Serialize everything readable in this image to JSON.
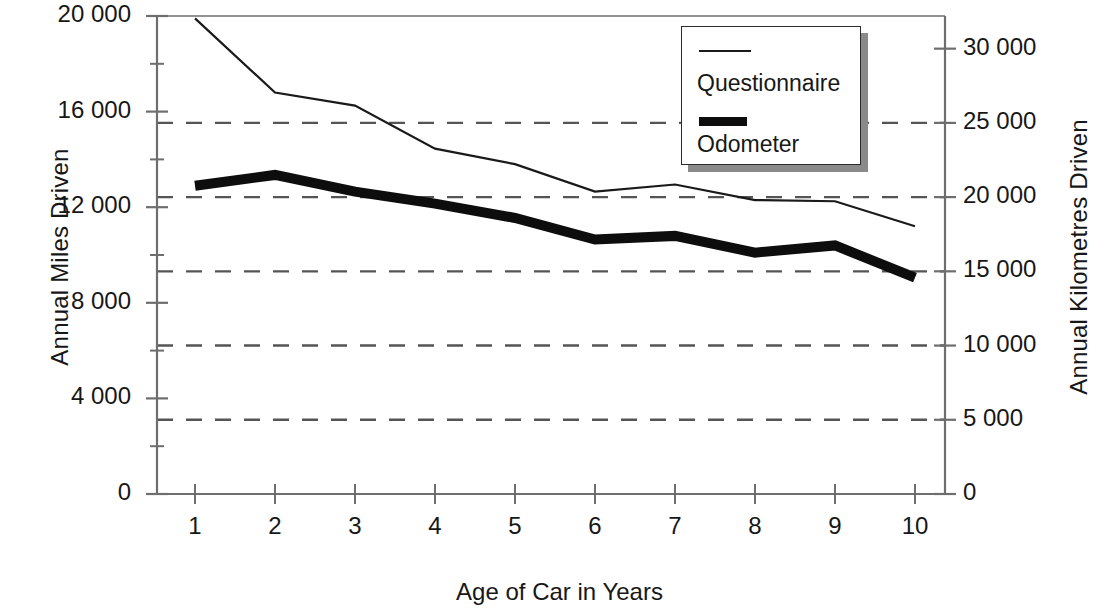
{
  "chart_data": {
    "type": "line",
    "title": "",
    "xlabel": "Age of Car in Years",
    "ylabel": "Annual Miles Driven",
    "ylabel_secondary": "Annual Kilometres Driven",
    "x": [
      1,
      2,
      3,
      4,
      5,
      6,
      7,
      8,
      9,
      10
    ],
    "xtick_labels": [
      "1",
      "2",
      "3",
      "4",
      "5",
      "6",
      "7",
      "8",
      "9",
      "10"
    ],
    "xlim": [
      0.7,
      10.4
    ],
    "ylim": [
      0,
      20000
    ],
    "ylim_secondary": [
      0,
      32200
    ],
    "ytick_values": [
      0,
      4000,
      8000,
      12000,
      16000,
      20000
    ],
    "ytick_labels": [
      "0",
      "4 000",
      "8 000",
      "12 000",
      "16 000",
      "20 000"
    ],
    "ytick_values_secondary": [
      0,
      5000,
      10000,
      15000,
      20000,
      25000,
      30000
    ],
    "ytick_labels_secondary": [
      "0",
      "5 000",
      "10 000",
      "15 000",
      "20 000",
      "25 000",
      "30 000"
    ],
    "grid": "horizontal-dashed-on-secondary-ticks",
    "gridlines_secondary": [
      5000,
      10000,
      15000,
      20000,
      25000
    ],
    "legend_position": "top-right",
    "series": [
      {
        "name": "Questionnaire",
        "style": "thin",
        "color": "#1a1a1a",
        "values": [
          19900,
          16800,
          16250,
          14450,
          13800,
          12650,
          12950,
          12300,
          12250,
          11200
        ]
      },
      {
        "name": "Odometer",
        "style": "thick",
        "color": "#0d0d0d",
        "values": [
          12900,
          13350,
          12650,
          12150,
          11550,
          10650,
          10800,
          10100,
          10400,
          9050
        ]
      }
    ]
  },
  "legend": {
    "entries": [
      {
        "label": "Questionnaire",
        "swatch": "thin-line-swatch"
      },
      {
        "label": "Odometer",
        "swatch": "thick-line-swatch"
      }
    ]
  },
  "colors": {
    "axis": "#6e6e6e",
    "grid": "#555555",
    "text": "#171717",
    "questionnaire": "#1a1a1a",
    "odometer": "#0d0d0d",
    "legend_shadow": "#8a8a8a"
  }
}
